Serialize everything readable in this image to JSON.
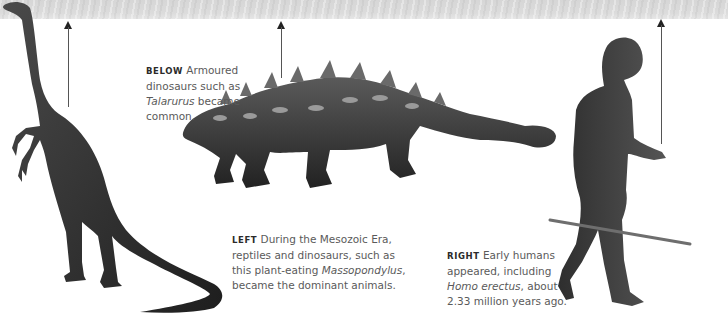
{
  "page": {
    "background": "#ffffff",
    "banner_color": "#d8d8d8",
    "arrow_color": "#333333",
    "caption_color": "#5a5a5a"
  },
  "captions": {
    "below": {
      "lead": "BELOW",
      "text_before": " Armoured dinosaurs such as ",
      "italic": "Talarurus",
      "text_after": " became common."
    },
    "left": {
      "lead": "LEFT",
      "text_before": " During the Mesozoic Era, reptiles and dinosaurs, such as this plant-eating ",
      "italic": "Massopondylus",
      "text_after": ", became the dominant animals."
    },
    "right": {
      "lead": "RIGHT",
      "text_before": " Early humans appeared, including ",
      "italic": "Homo erectus",
      "text_after": ", about 2.33 million years ago."
    }
  },
  "figures": [
    {
      "name": "Massopondylus",
      "kind": "sauropodomorph-dinosaur-illustration"
    },
    {
      "name": "Talarurus",
      "kind": "ankylosaur-dinosaur-illustration"
    },
    {
      "name": "Homo erectus",
      "kind": "early-human-illustration"
    }
  ],
  "arrows": [
    {
      "id": "massopondylus",
      "direction": "up"
    },
    {
      "id": "talarurus",
      "direction": "up"
    },
    {
      "id": "homo-erectus",
      "direction": "up"
    }
  ]
}
